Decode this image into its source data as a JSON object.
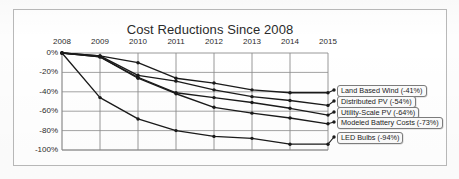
{
  "chart_data": {
    "type": "line",
    "title": "Cost Reductions Since 2008",
    "xlabel": "",
    "ylabel": "",
    "x": [
      2008,
      2009,
      2010,
      2011,
      2012,
      2013,
      2014,
      2015
    ],
    "xticklabels": [
      "2008",
      "2009",
      "2010",
      "2011",
      "2012",
      "2013",
      "2014",
      "2015"
    ],
    "yticklabels": [
      "0%",
      "-20%",
      "-40%",
      "-60%",
      "-80%",
      "-100%"
    ],
    "yticks": [
      0,
      -20,
      -40,
      -60,
      -80,
      -100
    ],
    "ylim": [
      -105,
      3
    ],
    "xlim": [
      2008,
      2015
    ],
    "grid": true,
    "x_axis_position": "top",
    "legend_position": "right-inline-labels",
    "series": [
      {
        "name": "Land Based Wind",
        "label": "Land Based Wind (-41%)",
        "final_value": -41,
        "values": [
          0,
          -3,
          -10,
          -26,
          -31,
          -38,
          -41,
          -41
        ]
      },
      {
        "name": "Distributed PV",
        "label": "Distributed PV (-54%)",
        "final_value": -54,
        "values": [
          0,
          -3,
          -23,
          -29,
          -38,
          -45,
          -49,
          -54
        ]
      },
      {
        "name": "Utility-Scale PV",
        "label": "Utility-Scale PV (-64%)",
        "final_value": -64,
        "values": [
          0,
          -4,
          -25,
          -41,
          -46,
          -51,
          -57,
          -64
        ]
      },
      {
        "name": "Modeled Battery Costs",
        "label": "Modeled Battery Costs (-73%)",
        "final_value": -73,
        "values": [
          0,
          -4,
          -26,
          -42,
          -56,
          -62,
          -67,
          -73
        ]
      },
      {
        "name": "LED Bulbs",
        "label": "LED Bulbs (-94%)",
        "final_value": -94,
        "values": [
          0,
          -46,
          -68,
          -80,
          -86,
          -88,
          -94,
          -94
        ]
      }
    ]
  },
  "colors": {
    "line": "#1a1a1a",
    "grid": "#8c8c8c",
    "axis": "#6f6f6f",
    "frame": "#b9b9b9",
    "text": "#2b2b2b",
    "legend_border": "#7d7d7d",
    "legend_background": "#fbfbfb"
  }
}
